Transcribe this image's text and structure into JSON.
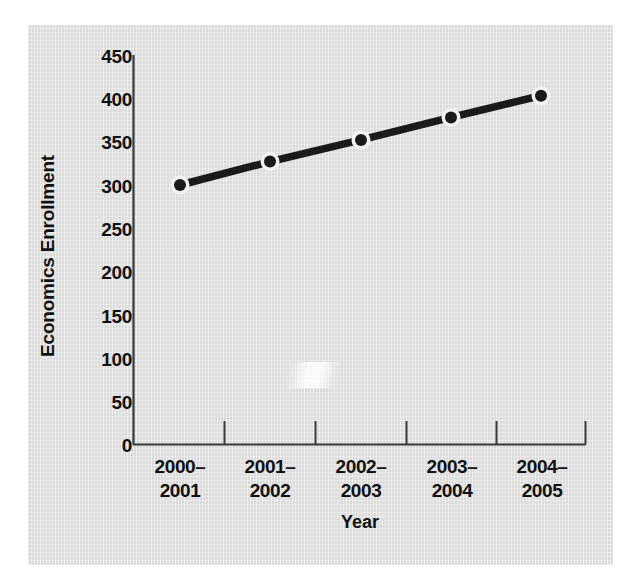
{
  "chart_data": {
    "type": "line",
    "title": "",
    "xlabel": "Year",
    "ylabel": "Economics Enrollment",
    "categories": [
      "2000–2001",
      "2001–2002",
      "2002–2003",
      "2003–2004",
      "2004–2005"
    ],
    "category_lines": [
      [
        "2000–",
        "2001"
      ],
      [
        "2001–",
        "2002"
      ],
      [
        "2002–",
        "2003"
      ],
      [
        "2003–",
        "2004"
      ],
      [
        "2004–",
        "2005"
      ]
    ],
    "values": [
      300,
      327,
      352,
      378,
      403
    ],
    "series": [
      {
        "name": "Economics Enrollment",
        "values": [
          300,
          327,
          352,
          378,
          403
        ]
      }
    ],
    "ylim": [
      0,
      450
    ],
    "yticks": [
      0,
      50,
      100,
      150,
      200,
      250,
      300,
      350,
      400,
      450
    ],
    "ytick_labels": [
      "0",
      "50",
      "100",
      "150",
      "200",
      "250",
      "300",
      "350",
      "400",
      "450"
    ],
    "grid": false,
    "legend": "none",
    "marker": "circle-white-halo",
    "colors": {
      "line": "#1a1a1a",
      "marker_fill": "#1a1a1a",
      "marker_halo": "#f2f2f2",
      "axis": "#3a3a3a",
      "text": "#111111",
      "panel_background": "#e3e3e3",
      "page_background": "#ffffff"
    }
  }
}
